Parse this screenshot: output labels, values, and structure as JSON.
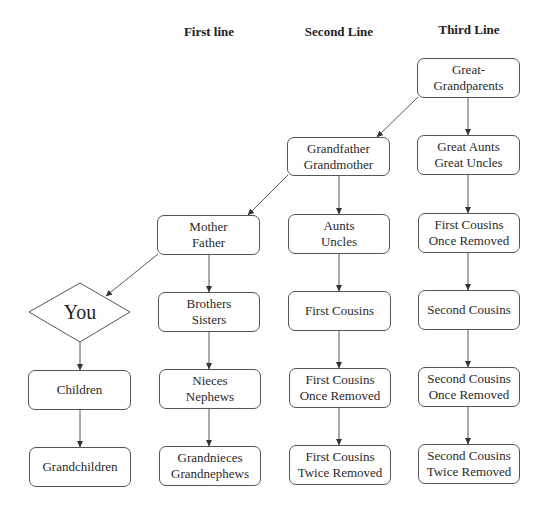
{
  "headers": {
    "first": "First line",
    "second": "Second Line",
    "third": "Third Line"
  },
  "you": {
    "label": "You"
  },
  "nodes": {
    "great_grandparents": [
      "Great-",
      "Grandparents"
    ],
    "grandparents": [
      "Grandfather",
      "Grandmother"
    ],
    "great_aunts_uncles": [
      "Great Aunts",
      "Great Uncles"
    ],
    "parents": [
      "Mother",
      "Father"
    ],
    "aunts_uncles": [
      "Aunts",
      "Uncles"
    ],
    "first_cousins_once_removed_top": [
      "First Cousins",
      "Once Removed"
    ],
    "siblings": [
      "Brothers",
      "Sisters"
    ],
    "first_cousins": [
      "First Cousins"
    ],
    "second_cousins": [
      "Second Cousins"
    ],
    "children": [
      "Children"
    ],
    "nieces_nephews": [
      "Nieces",
      "Nephews"
    ],
    "first_cousins_once_removed": [
      "First Cousins",
      "Once Removed"
    ],
    "second_cousins_once_removed": [
      "Second Cousins",
      "Once Removed"
    ],
    "grandchildren": [
      "Grandchildren"
    ],
    "grandnieces_grandnephews": [
      "Grandnieces",
      "Grandnephews"
    ],
    "first_cousins_twice_removed": [
      "First Cousins",
      "Twice Removed"
    ],
    "second_cousins_twice_removed": [
      "Second Cousins",
      "Twice Removed"
    ]
  },
  "colors": {
    "line": "#444444",
    "border": "#555555",
    "text": "#2a2a2a"
  }
}
